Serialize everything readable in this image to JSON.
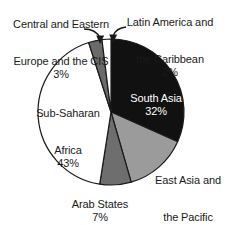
{
  "chart_data": {
    "type": "pie",
    "title": "",
    "subtitle": "",
    "xlabel": "",
    "ylabel": "",
    "legend_position": "none",
    "grid": false,
    "total_percent": 101,
    "start_angle_deg": 0,
    "direction": "clockwise",
    "categories": [
      "South Asia",
      "East Asia and the Pacific",
      "Arab States",
      "Sub-Saharan Africa",
      "Central and Eastern Europe and the CIS",
      "Latin America and the Caribbean"
    ],
    "values": [
      32,
      14,
      7,
      43,
      3,
      2
    ],
    "slices": [
      {
        "name": "South Asia",
        "label_line1": "South Asia",
        "percent_text": "32%",
        "value": 32,
        "color": "#111111",
        "text_color": "#ffffff",
        "label_placement": "inside"
      },
      {
        "name": "East Asia and the Pacific",
        "label_line1": "East Asia and",
        "label_line2": "the Pacific",
        "percent_text": "14%",
        "value": 14,
        "color": "#9b9b9b",
        "text_color": "#1a1a1a",
        "label_placement": "outside"
      },
      {
        "name": "Arab States",
        "label_line1": "Arab States",
        "percent_text": "7%",
        "value": 7,
        "color": "#6e6e6e",
        "text_color": "#1a1a1a",
        "label_placement": "outside"
      },
      {
        "name": "Sub-Saharan Africa",
        "label_line1": "Sub-Saharan",
        "label_line2": "Africa",
        "percent_text": "43%",
        "value": 43,
        "color": "#ffffff",
        "text_color": "#1a1a1a",
        "label_placement": "inside"
      },
      {
        "name": "Central and Eastern Europe and the CIS",
        "label_line1": "Central and Eastern",
        "label_line2": "Europe and the CIS",
        "percent_text": "3%",
        "value": 3,
        "color": "#6a6a6a",
        "text_color": "#1a1a1a",
        "label_placement": "outside",
        "has_leader_arrow": true
      },
      {
        "name": "Latin America and the Caribbean",
        "label_line1": "Latin America and",
        "label_line2": "the Caribbean",
        "percent_text": "2%",
        "value": 2,
        "color": "#ffffff",
        "text_color": "#1a1a1a",
        "label_placement": "outside",
        "has_leader_arrow": true
      }
    ]
  },
  "labels": {
    "south_asia": {
      "line1": "South Asia",
      "pct": "32%"
    },
    "east_asia": {
      "line1": "East Asia and",
      "line2": "the Pacific",
      "pct": "14%"
    },
    "arab_states": {
      "line1": "Arab States",
      "pct": "7%"
    },
    "sub_saharan": {
      "line1": "Sub-Saharan",
      "line2": "Africa",
      "pct": "43%"
    },
    "cee_cis": {
      "line1": "Central and Eastern",
      "line2": "Europe and the CIS",
      "pct": "3%"
    },
    "latin_america": {
      "line1": "Latin America and",
      "line2": "the Caribbean",
      "pct": "2%"
    }
  },
  "colors": {
    "outline": "#1a1a1a",
    "background": "#ffffff",
    "slice_black": "#111111",
    "slice_light_gray": "#9b9b9b",
    "slice_mid_gray": "#6e6e6e",
    "slice_dark_gray": "#6a6a6a",
    "slice_white": "#ffffff"
  }
}
